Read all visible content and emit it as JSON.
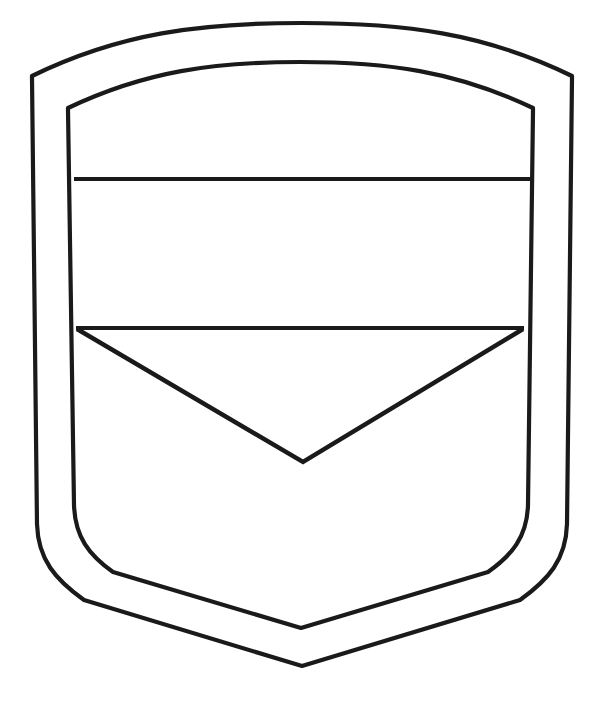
{
  "document": {
    "title": "Blank Shield Emblem Outline",
    "kind": "line-art-coloring-page",
    "canvas": {
      "width": 603,
      "height": 719,
      "background": "#ffffff"
    }
  },
  "style": {
    "stroke_color": "#1a1a1a",
    "fill_color": "none",
    "outer_stroke_width": 4.2,
    "inner_stroke_width": 4.2,
    "band_stroke_width": 4.0,
    "chevron_stroke_width": 4.4,
    "line_join": "miter",
    "line_cap": "butt"
  },
  "shapes": {
    "outer_shield": {
      "name": "outer-shield-border",
      "description": "Outer shield outline with arched top, straight slightly flaring sides, rounded lower corners and a pointed bottom tip",
      "path": "M 32 76 C 120 33 200 23 302 23 C 404 23 484 33 572 76 L 572 78 L 567 524 C 566 560 548 580 520 600 L 302 666 L 84 600 C 56 580 38 560 37 524 L 32 78 Z",
      "apex_y": 38,
      "left_corner": [
        32,
        76
      ],
      "right_corner": [
        572,
        76
      ],
      "bottom_tip": [
        302,
        666
      ]
    },
    "inner_shield": {
      "name": "inner-shield-border",
      "description": "Inner shield outline offset inward from the outer border, same silhouette",
      "path": "M 68 108 C 146 71 214 62 300 62 C 387 62 455 71 533 108 L 533 110 L 528 505 C 527 537 512 555 488 572 L 301 628 L 113 572 C 89 555 75 537 74 505 L 68 110 Z",
      "apex_y": 77,
      "left_corner": [
        68,
        108
      ],
      "right_corner": [
        533,
        108
      ],
      "bottom_tip": [
        301,
        628
      ]
    },
    "band_line_top": {
      "name": "upper-band-divider",
      "description": "Straight horizontal rule crossing the inner shield, separating the chief from the middle band",
      "x1": 74,
      "y1": 179,
      "x2": 531,
      "y2": 179
    },
    "band_line_bottom": {
      "name": "lower-band-divider",
      "description": "Straight horizontal rule crossing the inner shield, bottom of the middle band and top of the chevron",
      "x1": 76,
      "y1": 328,
      "x2": 524,
      "y2": 328
    },
    "chevron": {
      "name": "chevron-v-shape",
      "description": "Downward pointing V whose arms start at the ends of the lower band divider and meet at a point",
      "left_point": [
        77,
        329
      ],
      "apex": [
        303,
        462
      ],
      "right_point": [
        523,
        329
      ],
      "path": "M 77 329 L 303 462 L 523 329"
    }
  },
  "regions": [
    {
      "name": "chief-region",
      "label": "Top arched field"
    },
    {
      "name": "fess-region",
      "label": "Middle horizontal band"
    },
    {
      "name": "base-region",
      "label": "Lower field with chevron"
    }
  ]
}
